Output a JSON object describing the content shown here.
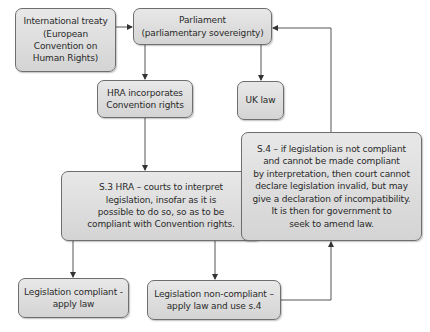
{
  "diagram": {
    "type": "flowchart",
    "nodes": [
      {
        "id": "treaty",
        "label": "International treaty\n(European\nConvention on\nHuman Rights)"
      },
      {
        "id": "parliament",
        "label": "Parliament\n(parliamentary sovereignty)"
      },
      {
        "id": "hra",
        "label": "HRA incorporates\nConvention rights"
      },
      {
        "id": "uk_law",
        "label": "UK law"
      },
      {
        "id": "s3",
        "label": "S.3 HRA – courts to interpret\nlegislation, insofar as it is\npossible to do so, so as to be\ncompliant with Convention rights."
      },
      {
        "id": "s4",
        "label": "S.4 – if legislation is not compliant\nand cannot be made compliant\nby interpretation, then court cannot\ndeclare legislation invalid, but may\ngive a declaration of incompatibility.\nIt is then for government to\nseek to amend law."
      },
      {
        "id": "compliant",
        "label": "Legislation compliant -\napply law"
      },
      {
        "id": "non_compliant",
        "label": "Legislation non-compliant –\napply law and use s.4"
      }
    ],
    "edges": [
      {
        "from": "treaty",
        "to": "parliament"
      },
      {
        "from": "parliament",
        "to": "hra"
      },
      {
        "from": "parliament",
        "to": "uk_law"
      },
      {
        "from": "hra",
        "to": "s3"
      },
      {
        "from": "s3",
        "to": "compliant"
      },
      {
        "from": "s3",
        "to": "non_compliant"
      },
      {
        "from": "non_compliant",
        "to": "s4"
      },
      {
        "from": "s4",
        "to": "parliament"
      }
    ],
    "colors": {
      "node_fill_top": "#e8e8e8",
      "node_fill_bottom": "#d4d4d4",
      "node_border": "#6e6e6e",
      "connector": "#555555",
      "text": "#2a2a2a"
    }
  }
}
